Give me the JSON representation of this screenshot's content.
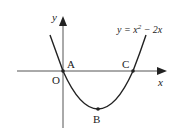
{
  "diagram": {
    "type": "parabola-graph",
    "equation": {
      "prefix": "y = x",
      "exponent": "2",
      "suffix": " − 2x"
    },
    "axes": {
      "x_label": "x",
      "y_label": "y",
      "origin_label": "O"
    },
    "points": [
      {
        "label": "A",
        "description": "origin intersection",
        "coords": [
          0,
          0
        ]
      },
      {
        "label": "B",
        "description": "vertex",
        "coords": [
          1,
          -1
        ]
      },
      {
        "label": "C",
        "description": "x-intercept",
        "coords": [
          2,
          0
        ]
      }
    ],
    "colors": {
      "stroke": "#222222",
      "background": "#ffffff"
    }
  }
}
